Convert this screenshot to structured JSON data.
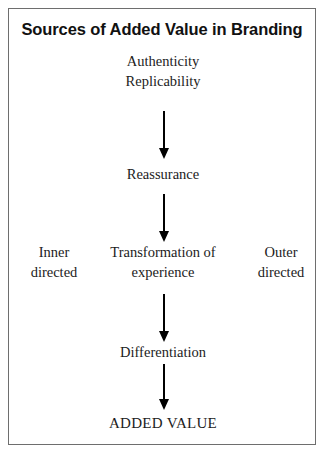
{
  "figure": {
    "title": "Sources of Added Value in Branding",
    "border_color": "#6e6e6e",
    "background_color": "#ffffff",
    "text_color": "#1c1c1c",
    "arrow_color": "#000000"
  },
  "diagram": {
    "type": "flowchart",
    "orientation": "vertical",
    "nodes": {
      "authenticity": "Authenticity\nReplicability",
      "reassurance": "Reassurance",
      "transformation": "Transformation of\nexperience",
      "differentiation": "Differentiation",
      "added_value": "ADDED VALUE",
      "inner_directed": "Inner\ndirected",
      "outer_directed": "Outer\ndirected"
    },
    "flow_sequence": [
      "Authenticity / Replicability",
      "Reassurance",
      "Transformation of experience",
      "Differentiation",
      "ADDED VALUE"
    ],
    "side_annotations": {
      "left": "Inner directed",
      "right": "Outer directed"
    },
    "arrows": [
      {
        "name": "arrow-authenticity-to-reassurance",
        "from": "Authenticity / Replicability",
        "to": "Reassurance"
      },
      {
        "name": "arrow-reassurance-to-transformation",
        "from": "Reassurance",
        "to": "Transformation of experience"
      },
      {
        "name": "arrow-transformation-to-differentiation",
        "from": "Transformation of experience",
        "to": "Differentiation"
      },
      {
        "name": "arrow-differentiation-to-added-value",
        "from": "Differentiation",
        "to": "ADDED VALUE"
      }
    ]
  }
}
